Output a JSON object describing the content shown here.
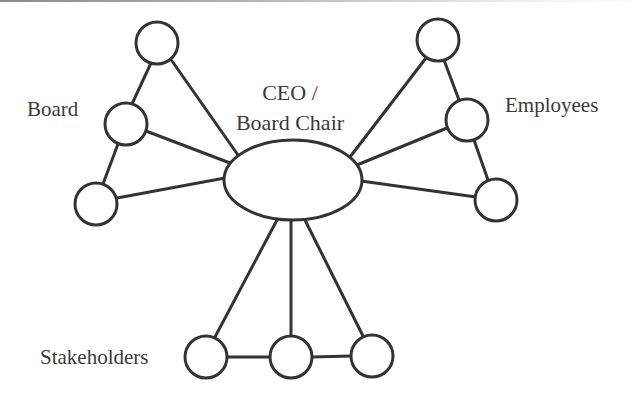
{
  "diagram": {
    "center": {
      "label_line1": "CEO /",
      "label_line2": "Board Chair",
      "shape": "ellipse"
    },
    "groups": [
      {
        "id": "board",
        "label": "Board",
        "node_count": 3
      },
      {
        "id": "employees",
        "label": "Employees",
        "node_count": 3
      },
      {
        "id": "stakeholders",
        "label": "Stakeholders",
        "node_count": 3
      }
    ],
    "colors": {
      "stroke": "#333333",
      "text": "#3a3a3a",
      "background": "#ffffff"
    }
  }
}
